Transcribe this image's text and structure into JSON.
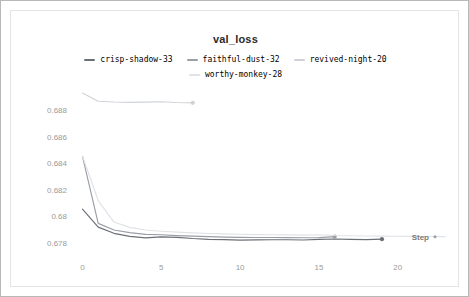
{
  "panel": {
    "title": "val_loss"
  },
  "axis": {
    "x_name": "Step",
    "x_ticks": [
      "0",
      "5",
      "10",
      "15",
      "20"
    ],
    "y_ticks": [
      "0.688",
      "0.686",
      "0.684",
      "0.682",
      "0.68",
      "0.678"
    ]
  },
  "legend": {
    "items": [
      {
        "label": "crisp-shadow-33",
        "color": "#6b6f76"
      },
      {
        "label": "faithful-dust-32",
        "color": "#9a9ea6"
      },
      {
        "label": "revived-night-20",
        "color": "#cfd3d8"
      },
      {
        "label": "worthy-monkey-28",
        "color": "#dfe2e6"
      }
    ]
  },
  "chart_data": {
    "type": "line",
    "title": "val_loss",
    "xlabel": "Step",
    "ylabel": "",
    "xlim": [
      -0.6,
      23.0
    ],
    "ylim": [
      0.6774,
      0.6896
    ],
    "grid": false,
    "legend_position": "top-center",
    "xticks": [
      0,
      5,
      10,
      15,
      20
    ],
    "yticks": [
      0.688,
      0.686,
      0.684,
      0.682,
      0.68,
      0.678
    ],
    "series": [
      {
        "name": "crisp-shadow-33",
        "color": "#6b6f76",
        "end_marker": true,
        "x": [
          0,
          1,
          2,
          3,
          4,
          5,
          6,
          7,
          8,
          9,
          10,
          11,
          12,
          13,
          14,
          15,
          16,
          17,
          18,
          19
        ],
        "y": [
          0.68055,
          0.6792,
          0.67873,
          0.6785,
          0.67839,
          0.67846,
          0.67843,
          0.67834,
          0.67828,
          0.67826,
          0.67822,
          0.67824,
          0.67825,
          0.67825,
          0.67823,
          0.67828,
          0.6783,
          0.67828,
          0.67826,
          0.67829
        ]
      },
      {
        "name": "faithful-dust-32",
        "color": "#9a9ea6",
        "end_marker": true,
        "x": [
          0,
          1,
          2,
          3,
          4,
          5,
          6,
          7,
          8,
          9,
          10,
          11,
          12,
          13,
          14,
          15,
          16
        ],
        "y": [
          0.68452,
          0.67948,
          0.67898,
          0.67878,
          0.67865,
          0.67862,
          0.67856,
          0.67852,
          0.67848,
          0.67845,
          0.67843,
          0.67842,
          0.67842,
          0.67841,
          0.6784,
          0.67841,
          0.67848
        ]
      },
      {
        "name": "revived-night-20",
        "color": "#cfd3d8",
        "end_marker": true,
        "x": [
          0,
          1,
          2,
          3,
          4,
          5,
          6,
          7
        ],
        "y": [
          0.6893,
          0.68868,
          0.68862,
          0.68859,
          0.68861,
          0.68864,
          0.68858,
          0.68856
        ]
      },
      {
        "name": "worthy-monkey-28",
        "color": "#dfe2e6",
        "end_marker": false,
        "x": [
          0,
          1,
          2,
          3,
          4,
          5,
          6,
          7,
          8,
          9,
          10,
          11,
          12,
          13,
          14,
          15,
          16,
          17,
          18,
          19,
          20,
          21,
          22,
          23
        ],
        "y": [
          0.68455,
          0.6812,
          0.67958,
          0.67918,
          0.67898,
          0.67889,
          0.67882,
          0.67876,
          0.67872,
          0.67869,
          0.67866,
          0.67863,
          0.67862,
          0.67861,
          0.6786,
          0.67862,
          0.67857,
          0.67855,
          0.67853,
          0.67852,
          0.67851,
          0.6785,
          0.67849,
          0.67848
        ]
      }
    ]
  }
}
